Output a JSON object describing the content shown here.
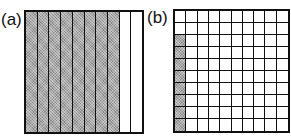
{
  "figure": {
    "panels": [
      {
        "label": "(a)",
        "type": "vertical-strips",
        "divisions": 10,
        "shaded_count": 8,
        "shaded_indices": [
          0,
          1,
          2,
          3,
          4,
          5,
          6,
          7
        ],
        "represents": "8 out of 10 strips shaded"
      },
      {
        "label": "(b)",
        "type": "grid",
        "rows": 10,
        "cols": 10,
        "shaded_count": 8,
        "shaded_cells": [
          {
            "row": 2,
            "col": 0
          },
          {
            "row": 3,
            "col": 0
          },
          {
            "row": 4,
            "col": 0
          },
          {
            "row": 5,
            "col": 0
          },
          {
            "row": 6,
            "col": 0
          },
          {
            "row": 7,
            "col": 0
          },
          {
            "row": 8,
            "col": 0
          },
          {
            "row": 9,
            "col": 0
          }
        ],
        "represents": "8 out of 100 squares shaded"
      }
    ],
    "colors": {
      "line": "#111111",
      "shade": "#a8a8a8",
      "background": "#ffffff"
    }
  }
}
